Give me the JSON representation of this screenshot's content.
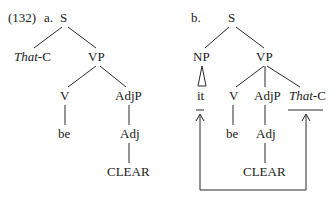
{
  "example": {
    "number": "(132)",
    "tree_a": {
      "label": "a.",
      "nodes": {
        "S": "S",
        "that_c_italic": "That",
        "that_c_rest": "-C",
        "VP": "VP",
        "V": "V",
        "AdjP": "AdjP",
        "be": "be",
        "Adj": "Adj",
        "CLEAR": "CLEAR"
      }
    },
    "tree_b": {
      "label": "b.",
      "nodes": {
        "S": "S",
        "NP": "NP",
        "VP": "VP",
        "it": "it",
        "V": "V",
        "AdjP": "AdjP",
        "that_c_italic": "That",
        "that_c_rest": "-C",
        "be": "be",
        "Adj": "Adj",
        "CLEAR": "CLEAR"
      },
      "movement": "arrows from bottom connecting line up to 'it' and 'That-C' positions"
    }
  }
}
